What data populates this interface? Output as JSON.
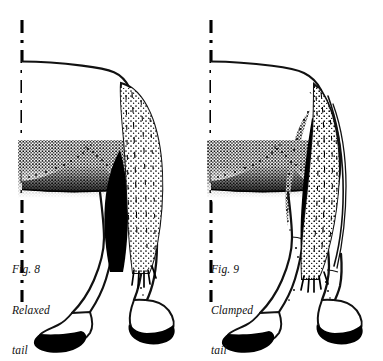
{
  "plate": {
    "background_color": "#ffffff",
    "ink_color": "#000000",
    "media": "black-and-white line illustration"
  },
  "figures": [
    {
      "id": "figure-left",
      "caption": {
        "number_line": "Fig. 8",
        "description_line": "Relaxed",
        "subject_line": "tail"
      },
      "subject": "horse hindquarters, rear three-quarter view",
      "tail_state": "relaxed",
      "reference_line": {
        "name": "vertical-dashed-reference-line",
        "style": "dash-dot",
        "x": 22,
        "y_top": 20,
        "y_bottom": 302
      },
      "shading": {
        "flank_band": "solid black with stippled upper edge",
        "tail_texture": "fine stipple and hatching"
      }
    },
    {
      "id": "figure-right",
      "caption": {
        "number_line": "Fig. 9",
        "description_line": "Clamped",
        "subject_line": "tail"
      },
      "subject": "horse hindquarters, rear three-quarter view",
      "tail_state": "clamped",
      "reference_line": {
        "name": "vertical-dashed-reference-line",
        "style": "dash-dot",
        "x": 23,
        "y_top": 20,
        "y_bottom": 302
      },
      "shading": {
        "flank_band": "solid black with stippled upper edge",
        "tail_texture": "fine stipple and hatching, tail pressed to buttock"
      }
    }
  ]
}
